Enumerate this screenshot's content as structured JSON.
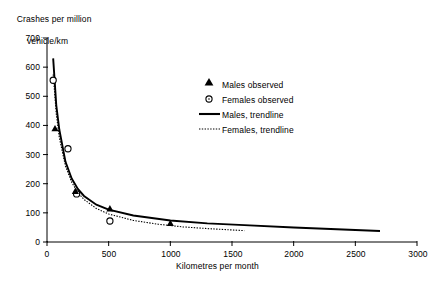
{
  "chart_data": {
    "type": "scatter",
    "title": "",
    "ylabel": "Crashes per million vehicle/km",
    "xlabel": "Kilometres per month",
    "xlim": [
      0,
      3000
    ],
    "ylim": [
      0,
      700
    ],
    "xticks": [
      0,
      500,
      1000,
      1500,
      2000,
      2500,
      3000
    ],
    "yticks": [
      0,
      100,
      200,
      300,
      400,
      500,
      600,
      700
    ],
    "grid": false,
    "legend_position": "upper-right",
    "series": [
      {
        "name": "Males observed",
        "marker": "filled-triangle",
        "x": [
          65,
          230,
          510,
          1000
        ],
        "y": [
          390,
          175,
          115,
          65
        ]
      },
      {
        "name": "Females observed",
        "marker": "open-circle",
        "x": [
          50,
          170,
          240,
          510
        ],
        "y": [
          555,
          320,
          165,
          72
        ]
      },
      {
        "name": "Males, trendline",
        "style": "solid-line",
        "x": [
          50,
          75,
          100,
          150,
          200,
          250,
          300,
          400,
          500,
          700,
          1000,
          1300,
          1600,
          2000,
          2400,
          2700
        ],
        "y": [
          630,
          470,
          385,
          275,
          218,
          182,
          158,
          128,
          111,
          91,
          74,
          64,
          58,
          50,
          43,
          38
        ]
      },
      {
        "name": "Females, trendline",
        "style": "dotted-line",
        "x": [
          50,
          75,
          100,
          150,
          200,
          250,
          300,
          400,
          500,
          700,
          900,
          1100,
          1300,
          1600
        ],
        "y": [
          575,
          440,
          358,
          260,
          205,
          170,
          146,
          115,
          96,
          74,
          61,
          52,
          46,
          39
        ]
      }
    ]
  },
  "axis": {
    "y_title_line1": "Crashes per million",
    "y_title_line2": "vehicle/km",
    "x_title": "Kilometres per month",
    "ytick_labels": [
      "700",
      "600",
      "500",
      "400",
      "300",
      "200",
      "100",
      "0"
    ],
    "xtick_labels": [
      "0",
      "500",
      "1000",
      "1500",
      "2000",
      "2500",
      "3000"
    ]
  },
  "legend": {
    "items": [
      {
        "label": "Males observed",
        "glyph": "filled-triangle-marker"
      },
      {
        "label": "Females observed",
        "glyph": "open-circle-marker"
      },
      {
        "label": "Males, trendline",
        "glyph": "solid-line-swatch"
      },
      {
        "label": "Females, trendline",
        "glyph": "dotted-line-swatch"
      }
    ]
  },
  "colors": {
    "ink": "#000000",
    "background": "#ffffff"
  }
}
